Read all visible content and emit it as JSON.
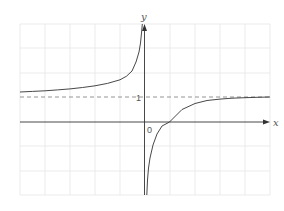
{
  "diagram": {
    "title": "",
    "function": "y = 1 - 1/x",
    "axes": {
      "x_label": "x",
      "y_label": "y",
      "origin_label": "0",
      "y_tick_label": "1"
    },
    "asymptotes": {
      "vertical": "x = 0",
      "horizontal": "y = 1"
    },
    "x_intercept": 1,
    "grid": {
      "x_range": [
        -5,
        5
      ],
      "y_range": [
        -3,
        4
      ],
      "step": 1
    },
    "colors": {
      "curve": "#333333",
      "axis": "#333333",
      "grid": "#e4e4e4",
      "asymptote": "#888888"
    }
  }
}
